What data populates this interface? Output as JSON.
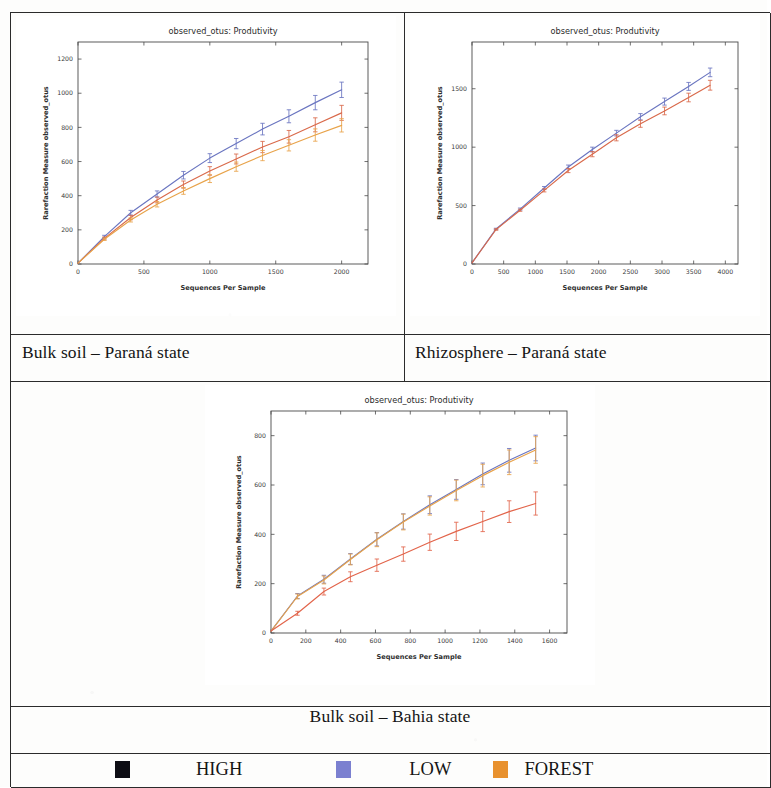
{
  "document": {
    "kind": "scanned-figure-table",
    "background": "#fdfdfc",
    "border_color": "#2b2b2b"
  },
  "captions": {
    "top_left": "Bulk soil –  Paraná state",
    "top_right": "Rhizosphere – Paraná state",
    "bottom": "Bulk soil –  Bahia state"
  },
  "legend": {
    "items": [
      {
        "label": "HIGH",
        "color": "#0d0d14",
        "swatch_name": "legend-swatch-high"
      },
      {
        "label": "LOW",
        "color": "#7b80d0",
        "swatch_name": "legend-swatch-low"
      },
      {
        "label": "FOREST",
        "color": "#e8912e",
        "swatch_name": "legend-swatch-forest"
      }
    ]
  },
  "colors": {
    "blue": "#6a75c0",
    "red": "#d9694a",
    "orange": "#e8a34a",
    "black": "#0d0d14"
  },
  "chart_data": [
    {
      "id": "bulk-soil-parana",
      "type": "line",
      "title": "observed_otus: Produtivity",
      "xlabel": "Sequences Per Sample",
      "ylabel": "Rarefaction Measure  observed_otus",
      "xlim": [
        0,
        2200
      ],
      "ylim": [
        0,
        1300
      ],
      "xticks": [
        0,
        500,
        1000,
        1500,
        2000
      ],
      "yticks": [
        0,
        200,
        400,
        600,
        800,
        1000,
        1200
      ],
      "grid": false,
      "legend_position": "none",
      "x": [
        0,
        200,
        400,
        600,
        800,
        1000,
        1200,
        1400,
        1600,
        1800,
        2000
      ],
      "series": [
        {
          "name": "LOW",
          "color": "#6a75c0",
          "values": [
            5,
            160,
            300,
            410,
            520,
            620,
            705,
            790,
            865,
            945,
            1020
          ],
          "err": [
            0,
            8,
            14,
            18,
            22,
            26,
            30,
            34,
            38,
            42,
            45
          ]
        },
        {
          "name": "HIGH",
          "color": "#d9694a",
          "values": [
            5,
            150,
            272,
            375,
            465,
            545,
            615,
            685,
            745,
            815,
            885
          ],
          "err": [
            0,
            8,
            13,
            17,
            21,
            25,
            29,
            33,
            37,
            41,
            44
          ]
        },
        {
          "name": "FOREST",
          "color": "#e8a34a",
          "values": [
            5,
            145,
            258,
            350,
            428,
            500,
            570,
            635,
            695,
            755,
            812
          ],
          "err": [
            0,
            7,
            12,
            16,
            20,
            23,
            27,
            30,
            33,
            36,
            39
          ]
        }
      ]
    },
    {
      "id": "rhizosphere-parana",
      "type": "line",
      "title": "observed_otus: Produtivity",
      "xlabel": "Sequences Per Sample",
      "ylabel": "Rarefaction Measure  observed_otus",
      "xlim": [
        0,
        4200
      ],
      "ylim": [
        0,
        1900
      ],
      "xticks": [
        0,
        500,
        1000,
        1500,
        2000,
        2500,
        3000,
        3500,
        4000
      ],
      "yticks": [
        0,
        500,
        1000,
        1500
      ],
      "grid": false,
      "legend_position": "none",
      "x": [
        0,
        380,
        760,
        1140,
        1520,
        1900,
        2280,
        2660,
        3040,
        3420,
        3760
      ],
      "series": [
        {
          "name": "LOW",
          "color": "#6a75c0",
          "values": [
            10,
            300,
            470,
            650,
            830,
            980,
            1120,
            1260,
            1390,
            1520,
            1640
          ],
          "err": [
            0,
            6,
            9,
            13,
            17,
            20,
            24,
            27,
            30,
            34,
            37
          ]
        },
        {
          "name": "HIGH",
          "color": "#d9694a",
          "values": [
            10,
            295,
            460,
            630,
            800,
            940,
            1080,
            1200,
            1310,
            1425,
            1530
          ],
          "err": [
            0,
            6,
            9,
            13,
            18,
            22,
            26,
            30,
            33,
            37,
            42
          ]
        }
      ]
    },
    {
      "id": "bulk-soil-bahia",
      "type": "line",
      "title": "observed_otus: Produtivity",
      "xlabel": "Sequences Per Sample",
      "ylabel": "Rarefaction Measure  observed_otus",
      "xlim": [
        0,
        1700
      ],
      "ylim": [
        0,
        900
      ],
      "xticks": [
        0,
        200,
        400,
        600,
        800,
        1000,
        1200,
        1400,
        1600
      ],
      "yticks": [
        0,
        200,
        400,
        600,
        800
      ],
      "grid": false,
      "legend_position": "none",
      "x": [
        0,
        152,
        304,
        456,
        608,
        760,
        912,
        1064,
        1216,
        1368,
        1520
      ],
      "series": [
        {
          "name": "LOW",
          "color": "#6a75c0",
          "values": [
            8,
            150,
            218,
            300,
            380,
            452,
            520,
            582,
            645,
            700,
            750
          ],
          "err": [
            0,
            10,
            16,
            22,
            27,
            31,
            36,
            40,
            44,
            48,
            52
          ]
        },
        {
          "name": "FOREST",
          "color": "#e8a34a",
          "values": [
            8,
            148,
            215,
            298,
            378,
            450,
            515,
            578,
            638,
            692,
            742
          ],
          "err": [
            0,
            10,
            16,
            22,
            28,
            32,
            37,
            42,
            46,
            50,
            54
          ]
        },
        {
          "name": "HIGH",
          "color": "#e2644a",
          "values": [
            8,
            80,
            168,
            228,
            275,
            320,
            368,
            412,
            452,
            492,
            525
          ],
          "err": [
            0,
            8,
            14,
            20,
            25,
            29,
            33,
            37,
            41,
            44,
            47
          ]
        }
      ]
    }
  ]
}
